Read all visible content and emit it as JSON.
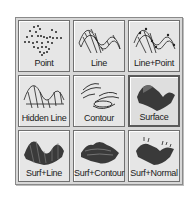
{
  "plot_style_picker": {
    "selected": "Surface",
    "items": [
      {
        "label": "Point",
        "icon": "point-plot-icon"
      },
      {
        "label": "Line",
        "icon": "line-plot-icon"
      },
      {
        "label": "Line+Point",
        "icon": "line-point-plot-icon"
      },
      {
        "label": "Hidden Line",
        "icon": "hidden-line-plot-icon"
      },
      {
        "label": "Contour",
        "icon": "contour-plot-icon"
      },
      {
        "label": "Surface",
        "icon": "surface-plot-icon"
      },
      {
        "label": "Surf+Line",
        "icon": "surface-line-plot-icon"
      },
      {
        "label": "Surf+Contour",
        "icon": "surface-contour-plot-icon"
      },
      {
        "label": "Surf+Normal",
        "icon": "surface-normal-plot-icon"
      }
    ]
  }
}
